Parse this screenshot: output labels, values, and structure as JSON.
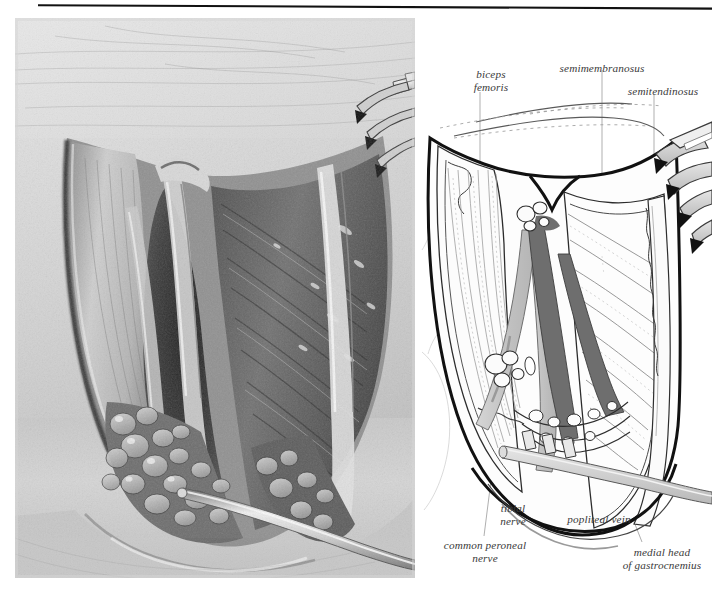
{
  "figure": {
    "panels": [
      {
        "name": "photograph",
        "kind": "grayscale-clinical-photograph"
      },
      {
        "name": "line-diagram",
        "kind": "labelled-line-drawing"
      }
    ]
  },
  "labels": {
    "biceps_femoris": "biceps\nfemoris",
    "semimembranosus": "semimembranosus",
    "semitendinosus": "semitendinosus",
    "tibial_nerve": "tibial\nnerve",
    "popliteal_vein": "popliteal vein",
    "common_peroneal_nerve": "common peroneal\nnerve",
    "medial_head_of_gastrocnemius": "medial head\nof gastrocnemius"
  },
  "colors": {
    "ink": "#1a1a1a",
    "label_text": "#3a3a3a",
    "leader_line": "#9a9a9a",
    "nerve_fill": "#c9c9c9",
    "vein_fill": "#6e6e6e",
    "muscle_fill": "#fbfbfb",
    "instrument_fill": "#d8d8d8",
    "photo_base": "#b8b8b8",
    "rule": "#111111",
    "page_background": "#ffffff"
  }
}
